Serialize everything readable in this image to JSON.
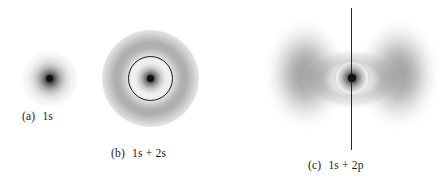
{
  "figure": {
    "background_color": "#ffffff",
    "ink_color": "#1a1a1a",
    "width": 447,
    "height": 187
  },
  "panels": [
    {
      "id": "a",
      "tag": "(a)",
      "label": "1s",
      "caption": "(a)   1s",
      "description": "small compact spherical electron cloud with dark nucleus dot",
      "center": {
        "x": 50,
        "y": 79
      },
      "cloud_radius": 28,
      "nucleus_radius": 3.5,
      "has_node_circle": false,
      "has_axis_line": false
    },
    {
      "id": "b",
      "tag": "(b)",
      "label": "1s + 2s",
      "caption": "(b)   1s + 2s",
      "description": "dense inner 1s core, a light spherical radial node marked by a drawn circle, and a diffuse outer 2s shell",
      "center": {
        "x": 150,
        "y": 78
      },
      "inner_cloud_radius": 22,
      "node_circle_radius": 21,
      "outer_shell_outer_radius": 48,
      "nucleus_radius": 3.5,
      "has_node_circle": true,
      "has_axis_line": false
    },
    {
      "id": "c",
      "tag": "(c)",
      "label": "1s + 2p",
      "caption": "(c)   1s + 2p",
      "description": "two large diffuse lobes left and right of a dark 1s core, with a vertical nodal axis line drawn through the nucleus",
      "center": {
        "x": 352,
        "y": 78
      },
      "lobe_left_center": {
        "x": 302,
        "y": 79
      },
      "lobe_right_center": {
        "x": 402,
        "y": 79
      },
      "lobe_width": 88,
      "lobe_height": 118,
      "core_radius": 21,
      "nucleus_radius": 4,
      "has_node_circle": false,
      "has_axis_line": true,
      "axis_line": {
        "x": 352,
        "y_top": 8,
        "y_bottom": 150
      }
    }
  ],
  "colors": {
    "background": "#ffffff",
    "nucleus": "#101010",
    "node_circle_stroke": "#1a1a1a",
    "axis_line": "#262626",
    "caption_text": "#1a1a1a",
    "cloud_mid_gray": "#808080"
  }
}
